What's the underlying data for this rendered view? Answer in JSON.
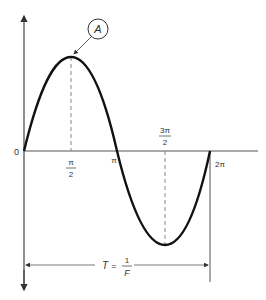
{
  "diagram": {
    "type": "sine-wave",
    "origin_label": "0",
    "x_ticks": [
      {
        "id": "pi_over_2",
        "num": "π",
        "den": "2"
      },
      {
        "id": "pi",
        "label": "π"
      },
      {
        "id": "three_pi_over_2",
        "num": "3π",
        "den": "2"
      },
      {
        "id": "two_pi",
        "label": "2π"
      }
    ],
    "peak_callout": "A",
    "period": {
      "lhs": "T",
      "eq": "=",
      "num": "1",
      "den": "F"
    },
    "colors": {
      "curve": "#111111",
      "axis": "#444444",
      "dashed": "#888888"
    }
  }
}
